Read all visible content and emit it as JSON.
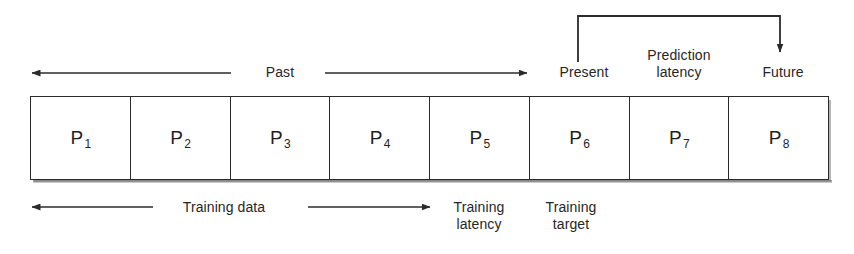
{
  "figure": {
    "stroke_color": "#2b2b2b",
    "text_color": "#262626"
  },
  "band": {
    "cells": [
      {
        "base": "P",
        "sub": "1"
      },
      {
        "base": "P",
        "sub": "2"
      },
      {
        "base": "P",
        "sub": "3"
      },
      {
        "base": "P",
        "sub": "4"
      },
      {
        "base": "P",
        "sub": "5"
      },
      {
        "base": "P",
        "sub": "6"
      },
      {
        "base": "P",
        "sub": "7"
      },
      {
        "base": "P",
        "sub": "8"
      }
    ]
  },
  "top_labels": {
    "past": "Past",
    "present": "Present",
    "prediction_latency_line1": "Prediction",
    "prediction_latency_line2": "latency",
    "future": "Future"
  },
  "bottom_labels": {
    "training_data": "Training data",
    "training_latency_line1": "Training",
    "training_latency_line2": "latency",
    "training_target_line1": "Training",
    "training_target_line2": "target"
  },
  "annotations": {
    "past_arrow_left": "left-arrow",
    "past_arrow_right": "right-arrow",
    "prediction_bracket": "bracket-with-down-arrow",
    "training_arrow_left": "left-arrow",
    "training_arrow_right": "right-arrow"
  }
}
